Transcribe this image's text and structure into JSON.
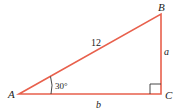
{
  "diagram": {
    "type": "right-triangle",
    "stroke_color": "#e8604c",
    "vertices": {
      "A": {
        "label": "A",
        "x": 19,
        "y": 94
      },
      "B": {
        "label": "B",
        "x": 161,
        "y": 14
      },
      "C": {
        "label": "C",
        "x": 161,
        "y": 94
      }
    },
    "sides": {
      "hypotenuse": {
        "label": "12"
      },
      "vertical": {
        "label": "a"
      },
      "horizontal": {
        "label": "b"
      }
    },
    "angle_A": {
      "label": "30°"
    },
    "right_angle_at": "C"
  }
}
